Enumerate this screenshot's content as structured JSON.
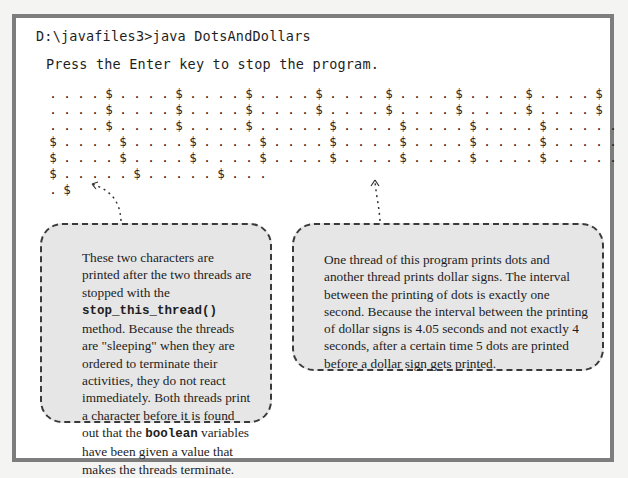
{
  "console": {
    "command_line": "D:\\javafiles3>java DotsAndDollars",
    "prompt_message": "Press the Enter key to stop the program.",
    "output_rows": [
      ". . . . $ . . . . $ . . . . $ . . . . $ . . . . $ . . . . $ . . . . $ . . . . $",
      ". . . . $ . . . . $ . . . . $ . . . . $ . . . . $ . . . . $ . . . . $ . . . . $",
      ". . . . $ . . . . $ . . . . $ . . . . . $ . . . . $ . . . . $ . . . . $ . . . . .",
      "$ . . . . $ . . . . $ . . . . $ . . . . $ . . . . $ . . . . $ . . . . $ . . . . .",
      "$ . . . . $ . . . . $ . . . . $ . . . . $ . . . . $ . . . . $ . . . . $ . . . . .",
      "$ . . . . . $ . . . . . $ . . .",
      ". $"
    ]
  },
  "callouts": {
    "left": {
      "text_parts": [
        "These two characters are printed after the two threads are stopped with the ",
        "stop_this_thread()",
        " method. Because the threads are \"sleeping\" when they are ordered to terminate their activities, they do not react immediately. Both threads print a character before it is found out that the ",
        "boolean",
        " variables have been given a value that makes the threads terminate."
      ]
    },
    "right": {
      "text": "One thread of this program prints dots and another thread prints dollar signs. The interval between the printing of dots is exactly one second. Because the interval between the printing of dollar signs is 4.05 seconds and not exactly 4 seconds, after a certain time 5 dots are printed before a dollar sign gets printed."
    }
  },
  "colors": {
    "frame_border": "#7d7d7d",
    "callout_fill": "#e6e6e6",
    "callout_border": "#3a3a3a",
    "text": "#1e1e1e"
  }
}
